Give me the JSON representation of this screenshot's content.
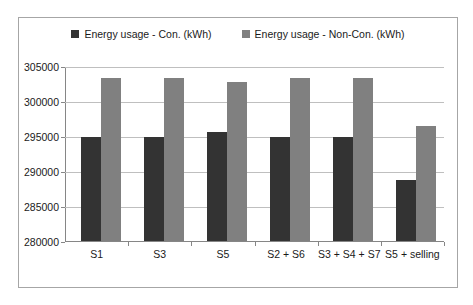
{
  "chart_data": {
    "type": "bar",
    "title": "",
    "xlabel": "",
    "ylabel": "",
    "categories": [
      "S1",
      "S3",
      "S5",
      "S2 + S6",
      "S3 + S4 + S7",
      "S5 + selling"
    ],
    "series": [
      {
        "name": "Energy usage - Con. (kWh)",
        "color": "#333333",
        "values": [
          295000,
          295000,
          295700,
          295000,
          295000,
          288900
        ]
      },
      {
        "name": "Energy usage - Non-Con. (kWh)",
        "color": "#808080",
        "values": [
          303400,
          303400,
          302900,
          303400,
          303400,
          296600
        ]
      }
    ],
    "ylim": [
      280000,
      305000
    ],
    "yticks": [
      280000,
      285000,
      290000,
      295000,
      300000,
      305000
    ],
    "ytick_labels": [
      "280000",
      "285000",
      "290000",
      "295000",
      "300000",
      "305000"
    ],
    "grid": true,
    "legend_position": "top"
  }
}
